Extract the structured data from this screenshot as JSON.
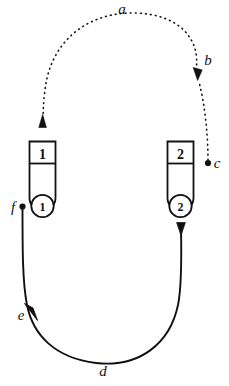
{
  "figure": {
    "title": "",
    "background_color": "#ffffff",
    "stroke_color": "#111111",
    "width": 229,
    "height": 386
  },
  "labels": {
    "a": "a",
    "b": "b",
    "c": "c",
    "d": "d",
    "e": "e",
    "f": "f"
  },
  "containers": [
    {
      "id": "left",
      "top_digit": "1",
      "bottom_circle_digit": "1"
    },
    {
      "id": "right",
      "top_digit": "2",
      "bottom_circle_digit": "2"
    }
  ],
  "paths": {
    "dotted_loop": {
      "style": "dotted",
      "label_top": "a",
      "label_arrow": "b",
      "label_origin_dot": "c",
      "description": "dotted curve from point c upward to arrowhead b, arcing left over the top past a, descending into an upward arrowhead above container 1"
    },
    "solid_loop": {
      "style": "solid",
      "label_origin_dot": "f",
      "label_arrow": "e",
      "label_bottom": "d",
      "description": "solid curve from point f at container 1 downward, arcing along the bottom past d, rising to a downward arrowhead below container 2"
    }
  }
}
